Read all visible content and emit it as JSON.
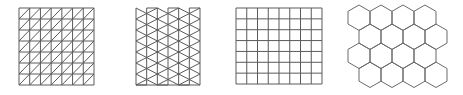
{
  "diagram": {
    "panels": [
      {
        "name": "right-triangle-grid",
        "label": "Square grid subdivided into right triangles",
        "x": 19,
        "y": 8,
        "width": 75,
        "height": 77,
        "cols": 7,
        "rows": 7
      },
      {
        "name": "equilateral-triangle-grid",
        "label": "Equilateral triangle grid",
        "x": 136,
        "y": 8,
        "width": 64,
        "height": 77,
        "cols": 6,
        "rows": 7
      },
      {
        "name": "square-grid",
        "label": "Square grid",
        "x": 236,
        "y": 8,
        "width": 86,
        "height": 76,
        "cols": 8,
        "rows": 7
      },
      {
        "name": "hexagon-grid",
        "label": "Hexagonal grid",
        "x": 348,
        "y": 5,
        "rows": 4,
        "cols": 4,
        "hex_width": 22,
        "hex_radius": 12.7
      }
    ],
    "colors": {
      "line": "#5a5a5a",
      "hex_line": "#6a6a6a",
      "background": "#ffffff"
    }
  }
}
